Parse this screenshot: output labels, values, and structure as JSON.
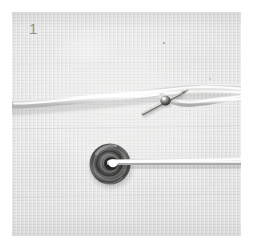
{
  "figure": {
    "panel_number": "1",
    "caption_visible": false,
    "page_background": "#ffffff",
    "plate": {
      "left": 12,
      "top": 12,
      "width": 229,
      "height": 224,
      "background_color": "#e6e6e5",
      "subject": "close-up photograph of a white cord on light gray fabric with a straight pin piercing the cord and a dark metal grommet eyelet with cord threaded through it"
    },
    "colors": {
      "fabric_light": "#ececeb",
      "fabric_mid": "#e0e0df",
      "fabric_dark": "#d5d5d4",
      "cord_highlight": "#fdfdfc",
      "cord_core": "#ebeae8",
      "cord_shadow": "#bdbdbc",
      "metal_dark": "#3b3b3b",
      "metal_mid": "#6f6f6e",
      "metal_light": "#b5b5b3",
      "pin_steel": "#8a8a89",
      "label_gray": "#8e8e8e"
    },
    "elements": {
      "upper_cord": {
        "name": "white cord upper run",
        "enters": "left edge",
        "exits": "right edge",
        "path_note": "gently waving horizontal cord crossing the upper third"
      },
      "straight_pin": {
        "name": "straight pin piercing the cord",
        "center_x": 150,
        "center_y": 92,
        "angle_deg": -28,
        "length": 44,
        "head_note": "small bright metallic bead head near the middle"
      },
      "grommet": {
        "name": "metal grommet eyelet",
        "center_x": 110,
        "center_y": 163,
        "outer_radius": 20,
        "inner_radius": 7,
        "ring_count": 4
      },
      "lower_cord": {
        "name": "white cord threaded through grommet",
        "enters": "grommet center",
        "exits": "right edge",
        "path_note": "straight horizontal run to the right edge"
      },
      "dust_specks": [
        {
          "x": 163,
          "y": 42
        },
        {
          "x": 209,
          "y": 78
        }
      ]
    }
  }
}
